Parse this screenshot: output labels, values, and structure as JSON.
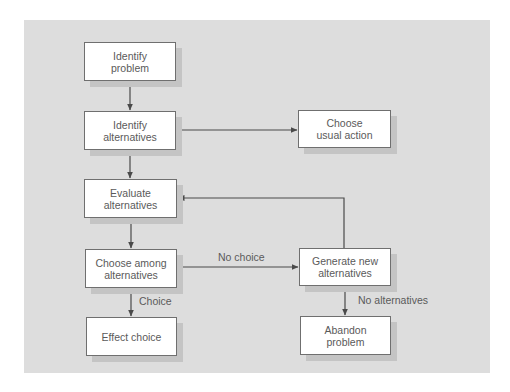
{
  "diagram": {
    "type": "flowchart",
    "background_color": "#dddddd",
    "node_border_color": "#6f6f6f",
    "line_color": "#4a4a4a",
    "text_color": "#5a5a5a",
    "nodes": {
      "identify_problem": {
        "label": "Identify\nproblem"
      },
      "identify_alternatives": {
        "label": "Identify\nalternatives"
      },
      "choose_usual_action": {
        "label": "Choose\nusual action"
      },
      "evaluate_alternatives": {
        "label": "Evaluate\nalternatives"
      },
      "choose_among_alternatives": {
        "label": "Choose among\nalternatives"
      },
      "generate_new_alternatives": {
        "label": "Generate new\nalternatives"
      },
      "effect_choice": {
        "label": "Effect choice"
      },
      "abandon_problem": {
        "label": "Abandon\nproblem"
      }
    },
    "edge_labels": {
      "no_choice": "No choice",
      "choice": "Choice",
      "no_alternatives": "No alternatives"
    },
    "edges": [
      {
        "from": "Identify problem",
        "to": "Identify alternatives",
        "label": ""
      },
      {
        "from": "Identify alternatives",
        "to": "Choose usual action",
        "label": ""
      },
      {
        "from": "Identify alternatives",
        "to": "Evaluate alternatives",
        "label": ""
      },
      {
        "from": "Evaluate alternatives",
        "to": "Choose among alternatives",
        "label": ""
      },
      {
        "from": "Choose among alternatives",
        "to": "Generate new alternatives",
        "label": "No choice"
      },
      {
        "from": "Choose among alternatives",
        "to": "Effect choice",
        "label": "Choice"
      },
      {
        "from": "Generate new alternatives",
        "to": "Evaluate alternatives",
        "label": ""
      },
      {
        "from": "Generate new alternatives",
        "to": "Abandon problem",
        "label": "No alternatives"
      }
    ]
  }
}
